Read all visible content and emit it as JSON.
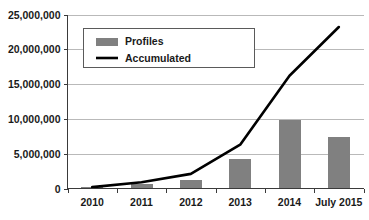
{
  "chart_data": {
    "type": "bar",
    "title": "",
    "subtitle": "",
    "xlabel": "",
    "ylabel": "",
    "categories": [
      "2010",
      "2011",
      "2012",
      "2013",
      "2014",
      "July 2015"
    ],
    "ylim": [
      0,
      25000000
    ],
    "y_ticks": [
      0,
      5000000,
      10000000,
      15000000,
      20000000,
      25000000
    ],
    "y_tick_labels": [
      "0",
      "5,000,000",
      "10,000,000",
      "15,000,000",
      "20,000,000",
      "25,000,000"
    ],
    "grid": true,
    "legend_position": "upper-left",
    "series": [
      {
        "name": "Profiles",
        "type": "bar",
        "color": "#808080",
        "values": [
          200000,
          700000,
          1200000,
          4300000,
          9800000,
          7400000
        ]
      },
      {
        "name": "Accumulated",
        "type": "line",
        "color": "#000000",
        "values": [
          200000,
          900000,
          2100000,
          6300000,
          16200000,
          23200000
        ]
      }
    ]
  },
  "legend": {
    "items": [
      {
        "label": "Profiles",
        "marker": "bar-swatch",
        "color": "#808080"
      },
      {
        "label": "Accumulated",
        "marker": "line-swatch",
        "color": "#000000"
      }
    ]
  },
  "axes": {
    "y_labels": [
      "25,000,000",
      "20,000,000",
      "15,000,000",
      "10,000,000",
      "5,000,000",
      "0"
    ],
    "x_labels": [
      "2010",
      "2011",
      "2012",
      "2013",
      "2014",
      "July 2015"
    ]
  },
  "colors": {
    "bar": "#808080",
    "line": "#000000",
    "grid": "#b9b9b9",
    "axis": "#3a3a3a",
    "background": "#ffffff",
    "text": "#1a1a1a"
  }
}
